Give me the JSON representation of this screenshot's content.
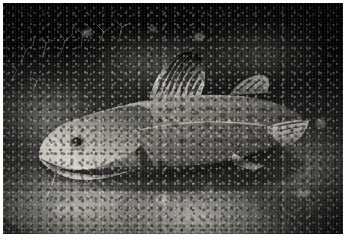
{
  "image": {
    "title": "Atlantic cod resting on an algae-encrusted rocky seabed",
    "medium": "underwater photograph",
    "tone": "monochrome",
    "border_color": "#ffffff",
    "frame": {
      "x": 3,
      "y": 3,
      "width": 340,
      "height": 231
    },
    "canvas": {
      "width": 351,
      "height": 241
    }
  },
  "palette": {
    "background_void": "#000000",
    "deep_shadow": "#0b0b0b",
    "rock_midtone": "#6a6862",
    "rock_highlight": "#d8d5cc",
    "fish_body_dark": "#4b4945",
    "fish_body_mid": "#8d8a82",
    "fish_belly_light": "#cfccc3",
    "fin_pale": "#e3e0d8",
    "eye_pupil": "#121210",
    "eye_iris": "#a9a69e"
  },
  "subject": {
    "name": "atlantic-cod",
    "label": "Atlantic cod",
    "orientation": "head-left",
    "parts": [
      {
        "name": "snout",
        "label": "Snout"
      },
      {
        "name": "lower-jaw",
        "label": "Lower jaw"
      },
      {
        "name": "chin-barbel",
        "label": "Chin barbel"
      },
      {
        "name": "eye",
        "label": "Eye"
      },
      {
        "name": "gill-cover",
        "label": "Gill cover"
      },
      {
        "name": "lateral-line",
        "label": "Lateral line"
      },
      {
        "name": "first-dorsal-fin",
        "label": "First dorsal fin"
      },
      {
        "name": "second-dorsal-fin",
        "label": "Second dorsal fin"
      },
      {
        "name": "pectoral-fin",
        "label": "Pectoral fin"
      },
      {
        "name": "pelvic-fin",
        "label": "Pelvic fin"
      },
      {
        "name": "anal-fin",
        "label": "Anal fin"
      },
      {
        "name": "caudal-peduncle",
        "label": "Caudal peduncle"
      },
      {
        "name": "tail-fin",
        "label": "Tail fin"
      },
      {
        "name": "mottled-flank",
        "label": "Mottled flank"
      }
    ]
  },
  "scene": {
    "elements": [
      {
        "name": "dark-water-column",
        "label": "Dark water column"
      },
      {
        "name": "rocky-outcrop",
        "label": "Rocky outcrop"
      },
      {
        "name": "encrusting-algae",
        "label": "Encrusting algae"
      },
      {
        "name": "branching-hydroids",
        "label": "Branching hydroids"
      },
      {
        "name": "seabed-rubble",
        "label": "Seabed rubble"
      }
    ]
  }
}
